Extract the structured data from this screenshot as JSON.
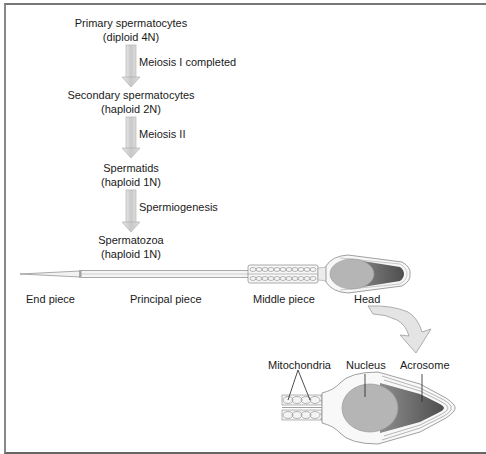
{
  "stages": [
    {
      "name": "Primary spermatocytes",
      "ploidy": "(diploid 4N)"
    },
    {
      "name": "Secondary spermatocytes",
      "ploidy": "(haploid 2N)"
    },
    {
      "name": "Spermatids",
      "ploidy": "(haploid 1N)"
    },
    {
      "name": "Spermatozoa",
      "ploidy": "(haploid 1N)"
    }
  ],
  "transitions": [
    "Meiosis I completed",
    "Meiosis II",
    "Spermiogenesis"
  ],
  "sperm_parts": [
    "End piece",
    "Principal piece",
    "Middle piece",
    "Head"
  ],
  "head_detail_labels": [
    "Mitochondria",
    "Nucleus",
    "Acrosome"
  ],
  "colors": {
    "arrow_fill": "#d4d4d4",
    "nucleus": "#b5b5b5",
    "acrosome": "#6e6e6e",
    "outline": "#8a8a8a"
  }
}
